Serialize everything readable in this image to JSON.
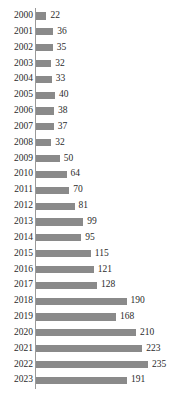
{
  "chart_data": {
    "type": "bar",
    "orientation": "horizontal",
    "title": "",
    "subtitle": "",
    "xlabel": "",
    "ylabel": "",
    "grid": false,
    "legend": null,
    "axis_color": "#9a9a9a",
    "bar_color": "#8a8a8a",
    "text_color": "#2b2b2b",
    "xlim": [
      0,
      235
    ],
    "categories": [
      "2000",
      "2001",
      "2002",
      "2003",
      "2004",
      "2005",
      "2006",
      "2007",
      "2008",
      "2009",
      "2010",
      "2011",
      "2012",
      "2013",
      "2014",
      "2015",
      "2016",
      "2017",
      "2018",
      "2019",
      "2020",
      "2021",
      "2022",
      "2023"
    ],
    "values": [
      22,
      36,
      35,
      32,
      33,
      40,
      38,
      37,
      32,
      50,
      64,
      70,
      81,
      99,
      95,
      115,
      121,
      128,
      190,
      168,
      210,
      223,
      235,
      191
    ],
    "data_labels": [
      "22",
      "36",
      "35",
      "32",
      "33",
      "40",
      "38",
      "37",
      "32",
      "50",
      "64",
      "70",
      "81",
      "99",
      "95",
      "115",
      "121",
      "128",
      "190",
      "168",
      "210",
      "223",
      "235",
      "191"
    ]
  }
}
